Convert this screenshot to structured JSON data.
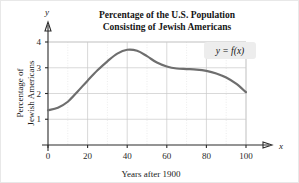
{
  "chart_data": {
    "type": "line",
    "title": "Percentage of the U.S. Population\nConsisting of Jewish Americans",
    "title_line1": "Percentage of the U.S. Population",
    "title_line2": "Consisting of Jewish Americans",
    "xlabel": "Years after 1900",
    "ylabel": "Percentage of\nJewish Americans",
    "ylabel_line1": "Percentage of",
    "ylabel_line2": "Jewish Americans",
    "x_axis_name": "x",
    "y_axis_name": "y",
    "annotation": "y = f(x)",
    "xlim": [
      0,
      112
    ],
    "ylim": [
      0,
      4.35
    ],
    "xticks": [
      0,
      20,
      40,
      60,
      80,
      100
    ],
    "xticklabels": [
      "0",
      "20",
      "40",
      "60",
      "80",
      "100"
    ],
    "yticks": [
      1,
      2,
      3,
      4
    ],
    "yticklabels": [
      "1",
      "2",
      "3",
      "4"
    ],
    "grid": true,
    "grid_major_x_step": 20,
    "grid_minor_x_step": 10,
    "grid_major_y_step": 1,
    "legend": "none",
    "series": [
      {
        "name": "y = f(x)",
        "color": "#6e6e6e",
        "x": [
          0,
          5,
          10,
          15,
          20,
          25,
          30,
          35,
          40,
          45,
          50,
          55,
          60,
          65,
          70,
          75,
          80,
          85,
          90,
          95,
          100
        ],
        "values": [
          1.35,
          1.45,
          1.68,
          2.08,
          2.5,
          2.9,
          3.25,
          3.55,
          3.7,
          3.66,
          3.45,
          3.2,
          3.05,
          2.97,
          2.95,
          2.93,
          2.88,
          2.78,
          2.62,
          2.38,
          2.05
        ]
      }
    ]
  },
  "colors": {
    "curve": "#6e6e6e",
    "axis": "#2b2b2b",
    "grid_major": "#c9c9c9",
    "grid_minor": "#dcdcdc",
    "annotation_box": "#ededed",
    "text": "#151515"
  }
}
